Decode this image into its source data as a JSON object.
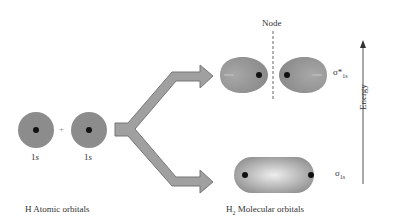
{
  "atomic": {
    "orbital_left_label_num": "1",
    "orbital_left_label_letter": "s",
    "orbital_right_label_num": "1",
    "orbital_right_label_letter": "s",
    "plus": "+",
    "caption": "H Atomic orbitals"
  },
  "molecular": {
    "antibonding_symbol": "σ*",
    "antibonding_sub": "1s",
    "bonding_symbol": "σ",
    "bonding_sub": "1s",
    "node_label": "Node",
    "caption_prefix": "H",
    "caption_sub": "2",
    "caption_rest": " Molecular orbitals"
  },
  "axis": {
    "label": "Energy"
  },
  "colors": {
    "orbital_fill": "#8c8c8c",
    "arrow_fill": "#a0a0a0",
    "nucleus": "#111111",
    "text": "#333333"
  }
}
